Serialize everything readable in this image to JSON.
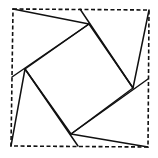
{
  "diagram": {
    "outer_square": {
      "style": "dashed"
    },
    "inner_square": {
      "style": "solid"
    },
    "triangles": [
      {
        "name": "top-left-triangle",
        "style": "solid"
      },
      {
        "name": "top-right-triangle",
        "style": "solid"
      },
      {
        "name": "bottom-right-triangle",
        "style": "solid"
      },
      {
        "name": "bottom-left-triangle",
        "style": "solid"
      }
    ],
    "line_color": "#111111",
    "background": "#ffffff"
  }
}
